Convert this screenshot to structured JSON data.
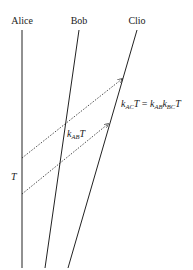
{
  "diagram": {
    "worldlines": [
      {
        "name": "Alice",
        "label": "Alice"
      },
      {
        "name": "Bob",
        "label": "Bob"
      },
      {
        "name": "Clio",
        "label": "Clio"
      }
    ],
    "signals": [
      {
        "from": "Alice",
        "to": "Clio",
        "style": "dotted",
        "arrow": true
      },
      {
        "from": "Alice",
        "to": "Clio",
        "style": "dotted",
        "arrow": true
      }
    ],
    "annotations": {
      "interval_label": "T",
      "bob_interval": {
        "k": "k",
        "sub": "AB",
        "T": "T"
      },
      "clio_interval": {
        "lhs_k": "k",
        "lhs_sub": "AC",
        "lhs_T": "T",
        "eq": " = ",
        "rhs_k1": "k",
        "rhs_sub1": "AB",
        "rhs_k2": "k",
        "rhs_sub2": "BC",
        "rhs_T": "T"
      }
    }
  }
}
